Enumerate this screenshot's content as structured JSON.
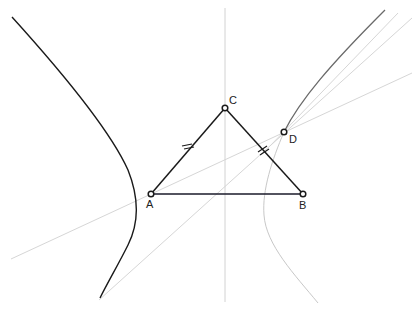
{
  "diagram": {
    "points": [
      {
        "id": "A",
        "label": "A"
      },
      {
        "id": "B",
        "label": "B"
      },
      {
        "id": "C",
        "label": "C"
      },
      {
        "id": "D",
        "label": "D"
      }
    ],
    "segments": [
      {
        "id": "AB",
        "from": "A",
        "to": "B"
      },
      {
        "id": "AC",
        "from": "A",
        "to": "C",
        "tick_marks": 2
      },
      {
        "id": "CB",
        "from": "C",
        "to": "B",
        "tick_marks": 2
      }
    ],
    "equal_sides": [
      "AC",
      "CB"
    ],
    "curves": [
      {
        "id": "left-branch",
        "style": "dark"
      },
      {
        "id": "right-upper-branch",
        "style": "dark"
      },
      {
        "id": "right-lower-branch",
        "style": "light"
      }
    ],
    "auxiliary_lines": [
      {
        "id": "perpendicular-bisector-AB",
        "style": "light",
        "orientation": "vertical"
      },
      {
        "id": "line-through-A-and-D",
        "style": "light"
      },
      {
        "id": "line-through-D-lower",
        "style": "light"
      },
      {
        "id": "line-through-D-steep",
        "style": "light"
      }
    ],
    "colors": {
      "dark": "#1a1a1a",
      "light": "#cfcfcf",
      "medium": "#6a6a6a"
    }
  }
}
